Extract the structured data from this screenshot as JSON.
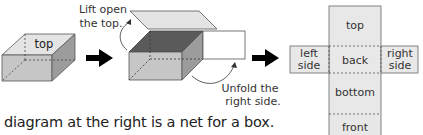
{
  "diagram": {
    "step1": {
      "top_label": "top"
    },
    "step2": {
      "lift_label_line1": "Lift open",
      "lift_label_line2": "the top.",
      "unfold_label_line1": "Unfold the",
      "unfold_label_line2": "right side."
    },
    "net": {
      "faces": {
        "top": "top",
        "left_line1": "left",
        "left_line2": "side",
        "back": "back",
        "right_line1": "right",
        "right_line2": "side",
        "bottom": "bottom",
        "front": "front"
      }
    },
    "caption": "diagram at the right is a net for a box."
  },
  "colors": {
    "face_light": "#e6e6e6",
    "face_mid": "#c4c4c4",
    "face_dark": "#5a5a5a",
    "face_side": "#9a9a9a",
    "outline": "#555555",
    "net_fill": "#e8e8e8",
    "arrow": "#000000"
  }
}
